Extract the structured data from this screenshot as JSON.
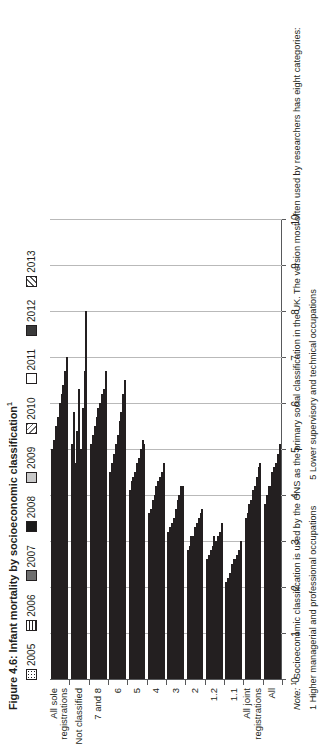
{
  "figure": {
    "title": "Figure 4.6: Infant mortality by socioeconomic classification",
    "title_footnote_marker": "1"
  },
  "note": {
    "label": "Note:",
    "marker": "1",
    "text": "Socioeconomic classification is used by the ONS as the primary social classification in the UK. The version most often used by researchers has eight categories:",
    "col1": "1 Higher managerial and professional occupations",
    "col2": "5 Lower supervisory and technical occupations"
  },
  "chart_data": {
    "type": "bar",
    "orientation": "horizontal",
    "title": "Figure 4.6: Infant mortality by socioeconomic classification",
    "xlabel": "",
    "ylabel": "",
    "ylim": [
      0,
      10
    ],
    "yticks": [
      "0",
      "1",
      "2",
      "3",
      "4",
      "5",
      "6",
      "7",
      "8",
      "9",
      "10"
    ],
    "grid": true,
    "legend_position": "top",
    "categories": [
      "All",
      "All joint registrations",
      "1.1",
      "1.2",
      "2",
      "3",
      "4",
      "5",
      "6",
      "7 and 8",
      "Not classified",
      "All sole registrations"
    ],
    "series": [
      {
        "name": "2005",
        "pattern": "p-dots",
        "values": [
          5.1,
          4.7,
          3.0,
          3.4,
          3.7,
          4.2,
          4.7,
          5.1,
          6.5,
          6.7,
          8.0,
          7.0
        ]
      },
      {
        "name": "2006",
        "pattern": "p-hlines",
        "values": [
          4.9,
          4.6,
          2.8,
          3.2,
          3.6,
          4.2,
          4.5,
          5.2,
          6.2,
          6.3,
          6.7,
          6.7
        ]
      },
      {
        "name": "2007",
        "pattern": "p-dgray",
        "values": [
          4.7,
          4.4,
          2.7,
          3.1,
          3.5,
          4.0,
          4.4,
          5.0,
          5.8,
          6.2,
          5.9,
          6.4
        ]
      },
      {
        "name": "2008",
        "pattern": "p-black",
        "values": [
          4.6,
          4.2,
          2.6,
          3.0,
          3.4,
          3.9,
          4.3,
          4.8,
          5.6,
          6.0,
          5.0,
          6.2
        ]
      },
      {
        "name": "2009",
        "pattern": "p-lgray",
        "values": [
          4.5,
          4.1,
          2.6,
          3.1,
          3.3,
          3.7,
          4.2,
          4.7,
          5.3,
          5.9,
          6.3,
          6.0
        ]
      },
      {
        "name": "2010",
        "pattern": "p-diag1",
        "values": [
          4.2,
          3.9,
          2.5,
          2.9,
          3.1,
          3.5,
          4.0,
          4.5,
          5.1,
          5.7,
          5.4,
          5.7
        ]
      },
      {
        "name": "2011",
        "pattern": "p-white",
        "values": [
          4.2,
          3.8,
          2.3,
          2.8,
          3.1,
          3.4,
          3.9,
          4.4,
          4.9,
          5.5,
          4.7,
          5.5
        ]
      },
      {
        "name": "2012",
        "pattern": "p-dark2",
        "values": [
          4.0,
          3.6,
          2.2,
          2.7,
          2.9,
          3.3,
          3.7,
          4.3,
          4.7,
          5.3,
          5.8,
          5.2
        ]
      },
      {
        "name": "2013",
        "pattern": "p-diag2",
        "values": [
          3.8,
          3.5,
          2.1,
          2.6,
          2.8,
          3.2,
          3.6,
          4.1,
          4.5,
          5.1,
          5.1,
          5.0
        ]
      }
    ]
  }
}
